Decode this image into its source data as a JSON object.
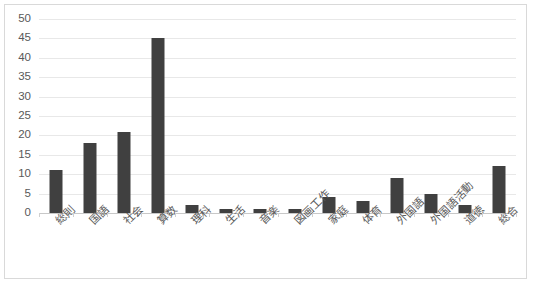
{
  "chart_data": {
    "type": "bar",
    "title": "",
    "subtitle": "",
    "xlabel": "",
    "ylabel": "",
    "ylim": [
      0,
      50
    ],
    "ytick_step": 5,
    "yticks": [
      50,
      45,
      40,
      35,
      30,
      25,
      20,
      15,
      10,
      5,
      0
    ],
    "grid": true,
    "legend": false,
    "legend_position": "none",
    "bar_color": "#404040",
    "gridline_color": "#e8e8e8",
    "axis_color": "#c8c8c8",
    "frame_border_color": "#d9d9d9",
    "tick_label_color": "#595959",
    "categories": [
      "総則",
      "国語",
      "社会",
      "算数",
      "理科",
      "生活",
      "音楽",
      "図画工作",
      "家庭",
      "体育",
      "外国語",
      "外国語活動",
      "道徳",
      "総合"
    ],
    "values": [
      11,
      18,
      21,
      45,
      2,
      1,
      1,
      1,
      4,
      3,
      9,
      5,
      2,
      12
    ]
  }
}
